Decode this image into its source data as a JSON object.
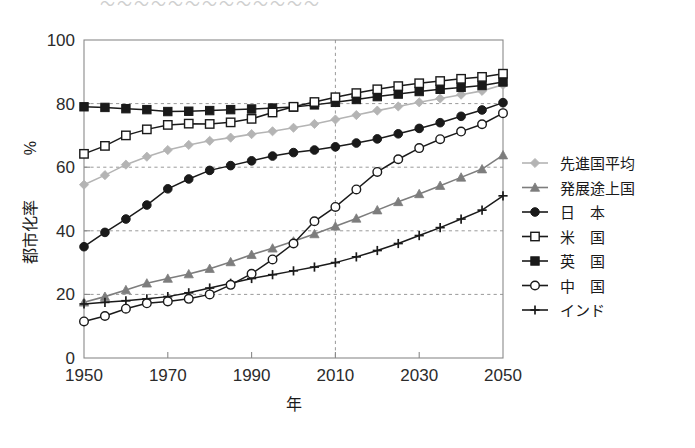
{
  "figure": {
    "cropped_title_remnant": "〜〜〜〜〜〜〜〜〜〜〜〜〜",
    "background_color": "#ffffff"
  },
  "axes": {
    "y_title": "都市化率",
    "y_unit": "%",
    "x_title": "年",
    "x_ticks": [
      "1950",
      "1970",
      "1990",
      "2010",
      "2030",
      "2050"
    ],
    "y_ticks": [
      "0",
      "20",
      "40",
      "60",
      "80",
      "100"
    ],
    "frame_color": "#8a8a8a",
    "grid_color": "#9a9a9a",
    "projection_divider_year": "2010"
  },
  "legend": {
    "items": [
      {
        "label": "先進国平均",
        "marker": "diamond",
        "color": "#b4b4b4",
        "line_color": "#b4b4b4"
      },
      {
        "label": "発展途上国",
        "marker": "triangle",
        "color": "#7d7d7d",
        "line_color": "#7d7d7d"
      },
      {
        "label": "日　本",
        "marker": "circle-filled",
        "color": "#1a1a1a",
        "line_color": "#1a1a1a"
      },
      {
        "label": "米　国",
        "marker": "square-open",
        "color": "#ffffff",
        "line_color": "#1a1a1a"
      },
      {
        "label": "英　国",
        "marker": "square-filled",
        "color": "#1a1a1a",
        "line_color": "#1a1a1a"
      },
      {
        "label": "中　国",
        "marker": "circle-open",
        "color": "#ffffff",
        "line_color": "#1a1a1a"
      },
      {
        "label": "インド",
        "marker": "plus",
        "color": "#1a1a1a",
        "line_color": "#1a1a1a"
      }
    ]
  },
  "chart_data": {
    "type": "line",
    "title": "",
    "xlabel": "年",
    "ylabel": "都市化率 %",
    "xlim": [
      1950,
      2050
    ],
    "ylim": [
      0,
      100
    ],
    "xticks": [
      1950,
      1970,
      1990,
      2010,
      2030,
      2050
    ],
    "yticks": [
      0,
      20,
      40,
      60,
      80,
      100
    ],
    "grid": "dashed-horizontal-at-20-40-60-80 plus dashed-vertical-at-2010",
    "legend_position": "right-outside",
    "x": [
      1950,
      1955,
      1960,
      1965,
      1970,
      1975,
      1980,
      1985,
      1990,
      1995,
      2000,
      2005,
      2010,
      2015,
      2020,
      2025,
      2030,
      2035,
      2040,
      2045,
      2050
    ],
    "series": [
      {
        "name": "先進国平均",
        "marker": "diamond",
        "color": "#b4b4b4",
        "values": [
          54.5,
          57.5,
          60.8,
          63.3,
          65.4,
          67.0,
          68.3,
          69.3,
          70.4,
          71.3,
          72.4,
          73.6,
          75.0,
          76.4,
          77.8,
          79.1,
          80.4,
          81.6,
          82.8,
          84.0,
          85.9
        ]
      },
      {
        "name": "発展途上国",
        "marker": "triangle",
        "color": "#7d7d7d",
        "values": [
          17.5,
          19.3,
          21.4,
          23.5,
          25.0,
          26.4,
          28.1,
          30.2,
          32.5,
          34.5,
          36.7,
          39.0,
          41.4,
          43.9,
          46.5,
          49.1,
          51.6,
          54.2,
          56.8,
          59.4,
          63.8
        ]
      },
      {
        "name": "日　本",
        "marker": "circle-filled",
        "color": "#1a1a1a",
        "values": [
          35.0,
          39.5,
          43.7,
          48.1,
          53.2,
          56.3,
          59.0,
          60.5,
          62.0,
          63.5,
          64.6,
          65.4,
          66.4,
          67.6,
          68.9,
          70.5,
          72.2,
          74.0,
          76.0,
          78.0,
          80.3
        ]
      },
      {
        "name": "米　国",
        "marker": "square-open",
        "color": "#1a1a1a",
        "values": [
          64.2,
          66.7,
          70.0,
          71.9,
          73.3,
          73.7,
          73.6,
          74.1,
          75.2,
          77.2,
          79.0,
          80.5,
          82.0,
          83.3,
          84.5,
          85.5,
          86.4,
          87.1,
          87.8,
          88.4,
          89.4
        ]
      },
      {
        "name": "英　国",
        "marker": "square-filled",
        "color": "#1a1a1a",
        "values": [
          79.0,
          78.8,
          78.4,
          78.1,
          77.5,
          77.6,
          77.8,
          78.1,
          78.3,
          78.6,
          78.9,
          79.6,
          80.4,
          81.3,
          82.2,
          83.0,
          83.8,
          84.5,
          85.1,
          85.7,
          86.8
        ]
      },
      {
        "name": "中　国",
        "marker": "circle-open",
        "color": "#1a1a1a",
        "values": [
          11.5,
          13.2,
          15.5,
          17.2,
          17.8,
          18.6,
          20.0,
          23.0,
          26.5,
          31.0,
          36.0,
          43.0,
          47.5,
          53.0,
          58.5,
          62.5,
          66.0,
          68.8,
          71.2,
          73.5,
          77.0
        ]
      },
      {
        "name": "インド",
        "marker": "plus",
        "color": "#1a1a1a",
        "values": [
          17.0,
          17.5,
          18.0,
          18.6,
          19.3,
          20.5,
          22.0,
          23.5,
          25.0,
          26.2,
          27.4,
          28.6,
          30.0,
          31.8,
          33.8,
          36.0,
          38.5,
          41.0,
          43.7,
          46.5,
          51.0
        ]
      }
    ]
  }
}
